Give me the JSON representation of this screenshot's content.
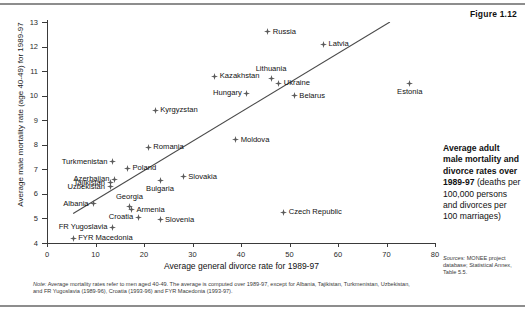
{
  "figure": {
    "number_label": "Figure 1.12",
    "caption_bold": "Average adult male mortality and divorce rates over 1989-97",
    "caption_rest": "(deaths per 100,000 persons and divorces per 100 marriages)",
    "sources_label": "Sources:",
    "sources_text": "MONEE project database; Statistical Annex, Table 5.5.",
    "note_label": "Note:",
    "note_text": "Average mortality rates refer to men aged 40-49. The average is computed over 1989-97, except for Albania, Tajikistan, Turkmenistan, Uzbekistan, and FR Yugoslavia (1989-96), Croatia (1993-96) and FYR Macedonia (1993-97)."
  },
  "chart_data": {
    "type": "scatter",
    "title": "Average adult male mortality and divorce rates over 1989-97",
    "xlabel": "Average general divorce rate for 1989-97",
    "ylabel": "Average male mortality rate (age 40-49) for 1989-97",
    "xlim": [
      0,
      80
    ],
    "ylim": [
      4,
      13
    ],
    "xticks": [
      0,
      10,
      20,
      30,
      40,
      50,
      60,
      70,
      80
    ],
    "yticks": [
      4,
      5,
      6,
      7,
      8,
      9,
      10,
      11,
      12,
      13
    ],
    "grid": false,
    "legend": "none",
    "trendline": {
      "x0": 5.4,
      "y0": 5.2,
      "x1": 70.7,
      "y1": 13.0
    },
    "points": [
      {
        "label": "Russia",
        "x": 45.5,
        "y": 12.6,
        "pos": "r"
      },
      {
        "label": "Latvia",
        "x": 57.0,
        "y": 12.1,
        "pos": "r"
      },
      {
        "label": "Estonia",
        "x": 74.8,
        "y": 10.5,
        "pos": "b"
      },
      {
        "label": "Lithuania",
        "x": 46.2,
        "y": 10.7,
        "pos": "t"
      },
      {
        "label": "Ukraine",
        "x": 47.8,
        "y": 10.5,
        "pos": "r"
      },
      {
        "label": "Kazakhstan",
        "x": 34.6,
        "y": 10.8,
        "pos": "r"
      },
      {
        "label": "Belarus",
        "x": 51.0,
        "y": 10.0,
        "pos": "r"
      },
      {
        "label": "Hungary",
        "x": 41.2,
        "y": 10.1,
        "pos": "l"
      },
      {
        "label": "Kyrgyzstan",
        "x": 22.3,
        "y": 9.4,
        "pos": "r"
      },
      {
        "label": "Moldova",
        "x": 38.9,
        "y": 8.2,
        "pos": "r"
      },
      {
        "label": "Romania",
        "x": 20.9,
        "y": 7.9,
        "pos": "r"
      },
      {
        "label": "Turkmenistan",
        "x": 13.5,
        "y": 7.3,
        "pos": "l"
      },
      {
        "label": "Poland",
        "x": 16.6,
        "y": 7.05,
        "pos": "r"
      },
      {
        "label": "Slovakia",
        "x": 28.1,
        "y": 6.7,
        "pos": "r"
      },
      {
        "label": "Azerbaijan",
        "x": 13.9,
        "y": 6.6,
        "pos": "l"
      },
      {
        "label": "Tajikistan",
        "x": 13.0,
        "y": 6.45,
        "pos": "l"
      },
      {
        "label": "Uzbekistan",
        "x": 13.0,
        "y": 6.3,
        "pos": "l"
      },
      {
        "label": "Bulgaria",
        "x": 23.3,
        "y": 6.55,
        "pos": "b"
      },
      {
        "label": "Albania",
        "x": 9.6,
        "y": 5.6,
        "pos": "l"
      },
      {
        "label": "Georgia",
        "x": 17.0,
        "y": 5.5,
        "pos": "t"
      },
      {
        "label": "Armenia",
        "x": 17.4,
        "y": 5.35,
        "pos": "r"
      },
      {
        "label": "Croatia",
        "x": 18.8,
        "y": 5.05,
        "pos": "l"
      },
      {
        "label": "Slovenia",
        "x": 23.3,
        "y": 4.95,
        "pos": "r"
      },
      {
        "label": "Czech Republic",
        "x": 48.8,
        "y": 5.25,
        "pos": "r"
      },
      {
        "label": "FR Yugoslavia",
        "x": 13.5,
        "y": 4.65,
        "pos": "l"
      },
      {
        "label": "FYR Macedonia",
        "x": 5.4,
        "y": 4.2,
        "pos": "r"
      }
    ]
  }
}
